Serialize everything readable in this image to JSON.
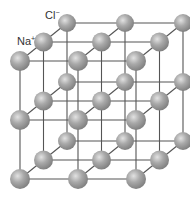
{
  "diagram": {
    "labels": [
      {
        "id": "cl",
        "text": "Cl",
        "charge": "−",
        "x": 45,
        "y": 10
      },
      {
        "id": "na",
        "text": "Na",
        "charge": "+",
        "x": 17,
        "y": 36
      }
    ],
    "colors": {
      "sphere_light": "#e2e2e2",
      "sphere_mid": "#a9a9a9",
      "sphere_dark": "#7c7c7c",
      "bond_line": "#555555",
      "background": "#ffffff"
    },
    "lattice": {
      "size": 3,
      "origin": [
        20,
        179
      ],
      "step_x": 58,
      "step_y": 59,
      "depth_dx": 23.5,
      "depth_dy": -19,
      "sphere_radius": 10
    }
  }
}
